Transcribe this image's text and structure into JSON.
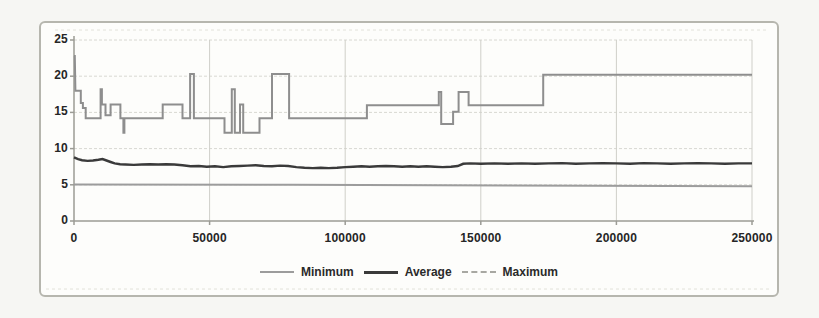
{
  "chart_data": {
    "type": "line",
    "title": "",
    "xlabel": "",
    "ylabel": "",
    "xlim": [
      0,
      250000
    ],
    "ylim": [
      0,
      25
    ],
    "x_ticks": [
      0,
      50000,
      100000,
      150000,
      200000,
      250000
    ],
    "x_tick_labels": [
      "0",
      "50000",
      "100000",
      "150000",
      "200000",
      "250000"
    ],
    "y_ticks": [
      0,
      5,
      10,
      15,
      20,
      25
    ],
    "y_tick_labels": [
      "0",
      "5",
      "10",
      "15",
      "20",
      "25"
    ],
    "grid": true,
    "legend_position": "bottom-center",
    "colors": {
      "minimum": "#9c9c9c",
      "average": "#3a3a3a",
      "maximum": "#8e8e8e",
      "grid": "#d8d8d2",
      "axis": "#9b9b95",
      "text": "#262626",
      "frame_border": "#b6b6ae"
    },
    "series": [
      {
        "name": "Minimum",
        "points": [
          [
            0,
            5.05
          ],
          [
            80000,
            5.0
          ],
          [
            160000,
            4.9
          ],
          [
            250000,
            4.8
          ]
        ]
      },
      {
        "name": "Average",
        "points": [
          [
            0,
            8.8
          ],
          [
            1500,
            8.55
          ],
          [
            3000,
            8.4
          ],
          [
            5000,
            8.3
          ],
          [
            7000,
            8.35
          ],
          [
            9000,
            8.45
          ],
          [
            10500,
            8.55
          ],
          [
            12000,
            8.35
          ],
          [
            13500,
            8.15
          ],
          [
            15000,
            7.95
          ],
          [
            17000,
            7.85
          ],
          [
            19000,
            7.8
          ],
          [
            22000,
            7.75
          ],
          [
            25000,
            7.8
          ],
          [
            28000,
            7.85
          ],
          [
            31000,
            7.8
          ],
          [
            34000,
            7.85
          ],
          [
            37000,
            7.8
          ],
          [
            40000,
            7.7
          ],
          [
            43000,
            7.55
          ],
          [
            46000,
            7.6
          ],
          [
            49000,
            7.5
          ],
          [
            52000,
            7.55
          ],
          [
            55000,
            7.45
          ],
          [
            58000,
            7.55
          ],
          [
            61000,
            7.6
          ],
          [
            64000,
            7.65
          ],
          [
            67000,
            7.7
          ],
          [
            70000,
            7.6
          ],
          [
            73000,
            7.55
          ],
          [
            76000,
            7.65
          ],
          [
            79000,
            7.6
          ],
          [
            82000,
            7.45
          ],
          [
            85000,
            7.35
          ],
          [
            88000,
            7.3
          ],
          [
            91000,
            7.35
          ],
          [
            94000,
            7.3
          ],
          [
            97000,
            7.35
          ],
          [
            100000,
            7.45
          ],
          [
            103000,
            7.5
          ],
          [
            106000,
            7.55
          ],
          [
            109000,
            7.5
          ],
          [
            112000,
            7.55
          ],
          [
            115000,
            7.6
          ],
          [
            118000,
            7.55
          ],
          [
            121000,
            7.5
          ],
          [
            124000,
            7.55
          ],
          [
            127000,
            7.5
          ],
          [
            130000,
            7.55
          ],
          [
            133000,
            7.5
          ],
          [
            136000,
            7.45
          ],
          [
            139000,
            7.5
          ],
          [
            141500,
            7.6
          ],
          [
            143500,
            7.9
          ],
          [
            146000,
            7.95
          ],
          [
            150000,
            7.9
          ],
          [
            155000,
            7.95
          ],
          [
            160000,
            7.9
          ],
          [
            165000,
            7.95
          ],
          [
            170000,
            7.9
          ],
          [
            175000,
            7.95
          ],
          [
            180000,
            8.0
          ],
          [
            185000,
            7.9
          ],
          [
            190000,
            7.95
          ],
          [
            195000,
            8.0
          ],
          [
            200000,
            7.95
          ],
          [
            205000,
            7.9
          ],
          [
            210000,
            8.0
          ],
          [
            215000,
            7.95
          ],
          [
            220000,
            7.9
          ],
          [
            225000,
            7.95
          ],
          [
            230000,
            8.0
          ],
          [
            235000,
            7.95
          ],
          [
            240000,
            7.9
          ],
          [
            245000,
            7.95
          ],
          [
            250000,
            7.95
          ]
        ]
      },
      {
        "name": "Maximum",
        "points": [
          [
            0,
            22.8
          ],
          [
            300,
            22.8
          ],
          [
            500,
            18
          ],
          [
            2500,
            18
          ],
          [
            2500,
            16.3
          ],
          [
            3300,
            16.3
          ],
          [
            3300,
            15.6
          ],
          [
            4300,
            15.6
          ],
          [
            4300,
            14.2
          ],
          [
            9800,
            14.2
          ],
          [
            9800,
            18.2
          ],
          [
            10300,
            18.2
          ],
          [
            10300,
            16.1
          ],
          [
            11600,
            16.1
          ],
          [
            11600,
            14.6
          ],
          [
            13500,
            14.6
          ],
          [
            13500,
            16.1
          ],
          [
            17100,
            16.1
          ],
          [
            17100,
            14.2
          ],
          [
            18200,
            14.2
          ],
          [
            18200,
            12.2
          ],
          [
            18600,
            12.2
          ],
          [
            18600,
            14.2
          ],
          [
            32700,
            14.2
          ],
          [
            32700,
            16.1
          ],
          [
            40000,
            16.1
          ],
          [
            40000,
            14.2
          ],
          [
            42800,
            14.2
          ],
          [
            42800,
            20.3
          ],
          [
            44200,
            20.3
          ],
          [
            44200,
            14.2
          ],
          [
            55500,
            14.2
          ],
          [
            55500,
            12.2
          ],
          [
            58200,
            12.2
          ],
          [
            58200,
            18.2
          ],
          [
            59300,
            18.2
          ],
          [
            59300,
            12.2
          ],
          [
            61200,
            12.2
          ],
          [
            61200,
            16.1
          ],
          [
            62400,
            16.1
          ],
          [
            62400,
            12.2
          ],
          [
            68400,
            12.2
          ],
          [
            68400,
            14.2
          ],
          [
            73000,
            14.2
          ],
          [
            73000,
            20.3
          ],
          [
            79300,
            20.3
          ],
          [
            79300,
            14.2
          ],
          [
            108000,
            14.2
          ],
          [
            108000,
            16.0
          ],
          [
            134500,
            16.0
          ],
          [
            134500,
            17.8
          ],
          [
            135400,
            17.8
          ],
          [
            135400,
            13.4
          ],
          [
            139800,
            13.4
          ],
          [
            139800,
            15.1
          ],
          [
            141800,
            15.1
          ],
          [
            141800,
            17.8
          ],
          [
            145500,
            17.8
          ],
          [
            145500,
            16.0
          ],
          [
            173000,
            16.0
          ],
          [
            173000,
            20.2
          ],
          [
            250000,
            20.2
          ]
        ]
      }
    ]
  },
  "legend": {
    "minimum_label": "Minimum",
    "average_label": "Average",
    "maximum_label": "Maximum"
  }
}
